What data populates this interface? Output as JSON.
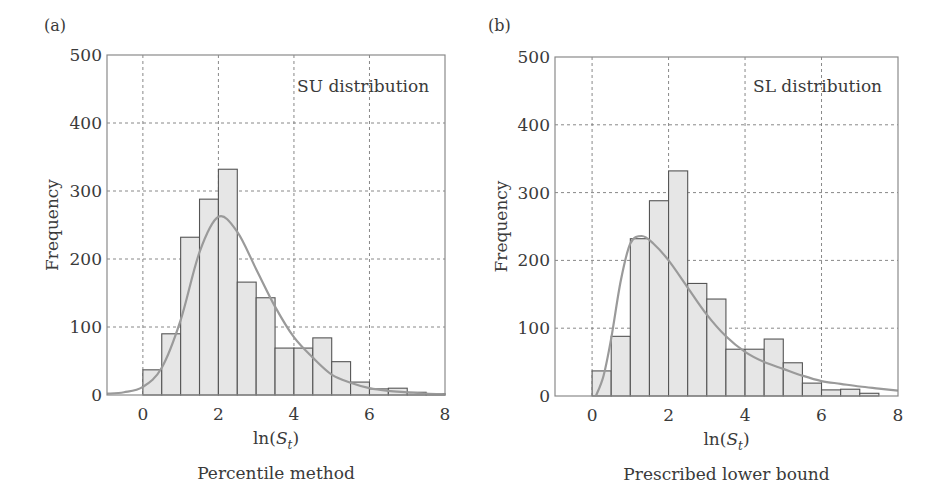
{
  "figure": {
    "panels": [
      {
        "id": "a",
        "panel_label": "(a)",
        "caption": "Percentile method",
        "annotation": "SU distribution"
      },
      {
        "id": "b",
        "panel_label": "(b)",
        "caption": "Prescribed lower bound",
        "annotation": "SL distribution"
      }
    ],
    "xlabel": "ln(S_t)",
    "xlabel_parts": {
      "prefix": "ln(",
      "var": "S",
      "sub": "t",
      "suffix": ")"
    },
    "ylabel": "Frequency",
    "xticks": [
      "0",
      "2",
      "4",
      "6",
      "8"
    ],
    "yticks": [
      "0",
      "100",
      "200",
      "300",
      "400",
      "500"
    ]
  },
  "colors": {
    "bar_fill": "#e6e6e6",
    "bar_stroke": "#555555",
    "curve": "#9a9a9a",
    "grid": "#7a7a7a",
    "frame": "#8a8a8a"
  },
  "chart_data": [
    {
      "type": "bar",
      "title": "SU distribution",
      "panel": "(a)",
      "caption": "Percentile method",
      "xlabel": "ln(S_t)",
      "ylabel": "Frequency",
      "xlim": [
        -0.95,
        8
      ],
      "ylim": [
        0,
        500
      ],
      "grid": true,
      "xticks": [
        0,
        2,
        4,
        6,
        8
      ],
      "yticks": [
        0,
        100,
        200,
        300,
        400,
        500
      ],
      "bin_width": 0.5,
      "bin_edges": [
        0,
        0.5,
        1.0,
        1.5,
        2.0,
        2.5,
        3.0,
        3.5,
        4.0,
        4.5,
        5.0,
        5.5,
        6.0,
        6.5,
        7.0,
        7.5,
        8.0
      ],
      "values": [
        37,
        90,
        232,
        288,
        332,
        166,
        143,
        69,
        69,
        84,
        49,
        19,
        9,
        10,
        4,
        2
      ],
      "series": [
        {
          "name": "Histogram",
          "type": "bar",
          "values": [
            37,
            90,
            232,
            288,
            332,
            166,
            143,
            69,
            69,
            84,
            49,
            19,
            9,
            10,
            4,
            2
          ]
        },
        {
          "name": "SU distribution fit",
          "type": "line",
          "x": [
            -0.95,
            -0.5,
            0,
            0.5,
            1.0,
            1.5,
            2.0,
            2.5,
            3.0,
            3.5,
            4.0,
            4.5,
            5.0,
            5.5,
            6.0,
            6.5,
            7.0,
            7.5,
            8.0
          ],
          "y": [
            2,
            4,
            12,
            40,
            110,
            210,
            262,
            240,
            185,
            130,
            85,
            55,
            30,
            18,
            10,
            6,
            4,
            2,
            1
          ]
        }
      ]
    },
    {
      "type": "bar",
      "title": "SL distribution",
      "panel": "(b)",
      "caption": "Prescribed lower bound",
      "xlabel": "ln(S_t)",
      "ylabel": "Frequency",
      "xlim": [
        -0.97,
        8
      ],
      "ylim": [
        0,
        500
      ],
      "grid": true,
      "xticks": [
        0,
        2,
        4,
        6,
        8
      ],
      "yticks": [
        0,
        100,
        200,
        300,
        400,
        500
      ],
      "bin_width": 0.5,
      "bin_edges": [
        0,
        0.5,
        1.0,
        1.5,
        2.0,
        2.5,
        3.0,
        3.5,
        4.0,
        4.5,
        5.0,
        5.5,
        6.0,
        6.5,
        7.0,
        7.5
      ],
      "values": [
        37,
        88,
        232,
        288,
        332,
        166,
        143,
        69,
        69,
        84,
        49,
        19,
        9,
        10,
        4
      ],
      "series": [
        {
          "name": "Histogram",
          "type": "bar",
          "values": [
            37,
            88,
            232,
            288,
            332,
            166,
            143,
            69,
            69,
            84,
            49,
            19,
            9,
            10,
            4
          ]
        },
        {
          "name": "SL distribution fit",
          "type": "line",
          "x": [
            0.1,
            0.3,
            0.5,
            0.75,
            1.0,
            1.3,
            1.6,
            2.0,
            2.5,
            3.0,
            3.5,
            4.0,
            4.5,
            5.0,
            5.5,
            6.0,
            6.5,
            7.0,
            7.5,
            8.0
          ],
          "y": [
            0,
            30,
            85,
            170,
            225,
            236,
            225,
            200,
            160,
            120,
            88,
            65,
            50,
            40,
            30,
            22,
            18,
            14,
            11,
            8
          ]
        }
      ]
    }
  ]
}
